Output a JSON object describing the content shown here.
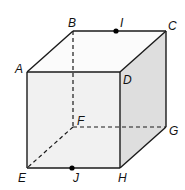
{
  "diagram": {
    "type": "cube",
    "colors": {
      "edge": "#1a1a1a",
      "front_face": "#f1f1f1",
      "right_face": "#dedede",
      "top_face": "#fbfbfb",
      "point": "#000000"
    },
    "vertices": {
      "A": "A",
      "B": "B",
      "C": "C",
      "D": "D",
      "E": "E",
      "F": "F",
      "G": "G",
      "H": "H"
    },
    "points": {
      "I": "I",
      "J": "J"
    }
  }
}
